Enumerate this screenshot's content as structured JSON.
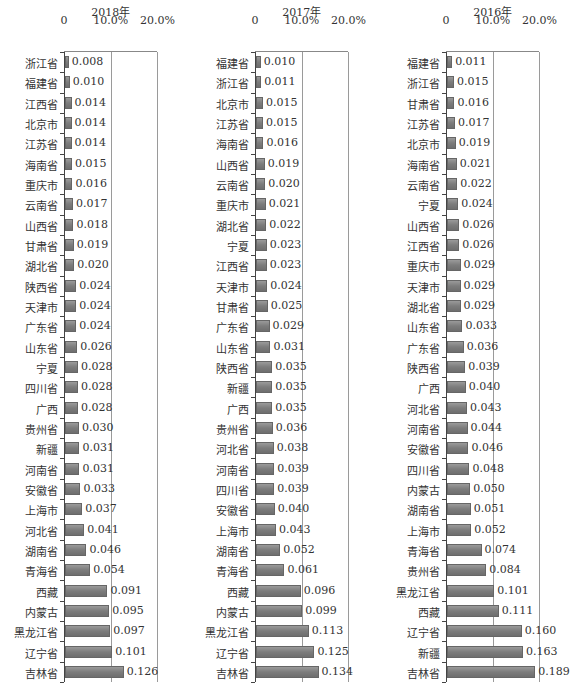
{
  "chart_data": [
    {
      "type": "bar",
      "orientation": "horizontal",
      "title": "2018年",
      "xticks": [
        "0",
        "10.0%",
        "20.0%"
      ],
      "xlim": [
        0,
        0.2
      ],
      "grid": true,
      "categories": [
        "浙江省",
        "福建省",
        "江西省",
        "北京市",
        "江苏省",
        "海南省",
        "重庆市",
        "云南省",
        "山西省",
        "甘肃省",
        "湖北省",
        "陕西省",
        "天津市",
        "广东省",
        "山东省",
        "宁夏",
        "四川省",
        "广西",
        "贵州省",
        "新疆",
        "河南省",
        "安徽省",
        "上海市",
        "河北省",
        "湖南省",
        "青海省",
        "西藏",
        "内蒙古",
        "黑龙江省",
        "辽宁省",
        "吉林省"
      ],
      "values": [
        0.008,
        0.01,
        0.014,
        0.014,
        0.014,
        0.015,
        0.016,
        0.017,
        0.018,
        0.019,
        0.02,
        0.024,
        0.024,
        0.024,
        0.026,
        0.028,
        0.028,
        0.028,
        0.03,
        0.031,
        0.031,
        0.033,
        0.037,
        0.041,
        0.046,
        0.054,
        0.091,
        0.095,
        0.097,
        0.101,
        0.126
      ],
      "labels": [
        "0.008",
        "0.010",
        "0.014",
        "0.014",
        "0.014",
        "0.015",
        "0.016",
        "0.017",
        "0.018",
        "0.019",
        "0.020",
        "0.024",
        "0.024",
        "0.024",
        "0.026",
        "0.028",
        "0.028",
        "0.028",
        "0.030",
        "0.031",
        "0.031",
        "0.033",
        "0.037",
        "0.041",
        "0.046",
        "0.054",
        "0.091",
        "0.095",
        "0.097",
        "0.101",
        "0.126"
      ]
    },
    {
      "type": "bar",
      "orientation": "horizontal",
      "title": "2017年",
      "xticks": [
        "0",
        "10.0%",
        "20.0%"
      ],
      "xlim": [
        0,
        0.2
      ],
      "grid": true,
      "categories": [
        "福建省",
        "浙江省",
        "北京市",
        "江苏省",
        "海南省",
        "山西省",
        "云南省",
        "重庆市",
        "湖北省",
        "宁夏",
        "江西省",
        "天津市",
        "甘肃省",
        "广东省",
        "山东省",
        "陕西省",
        "新疆",
        "广西",
        "贵州省",
        "河北省",
        "河南省",
        "四川省",
        "安徽省",
        "上海市",
        "湖南省",
        "青海省",
        "西藏",
        "内蒙古",
        "黑龙江省",
        "辽宁省",
        "吉林省"
      ],
      "values": [
        0.01,
        0.011,
        0.015,
        0.015,
        0.016,
        0.019,
        0.02,
        0.021,
        0.022,
        0.023,
        0.023,
        0.024,
        0.025,
        0.029,
        0.031,
        0.035,
        0.035,
        0.035,
        0.036,
        0.038,
        0.039,
        0.039,
        0.04,
        0.043,
        0.052,
        0.061,
        0.096,
        0.099,
        0.113,
        0.125,
        0.134
      ],
      "labels": [
        "0.010",
        "0.011",
        "0.015",
        "0.015",
        "0.016",
        "0.019",
        "0.020",
        "0.021",
        "0.022",
        "0.023",
        "0.023",
        "0.024",
        "0.025",
        "0.029",
        "0.031",
        "0.035",
        "0.035",
        "0.035",
        "0.036",
        "0.038",
        "0.039",
        "0.039",
        "0.040",
        "0.043",
        "0.052",
        "0.061",
        "0.096",
        "0.099",
        "0.113",
        "0.125",
        "0.134"
      ]
    },
    {
      "type": "bar",
      "orientation": "horizontal",
      "title": "2016年",
      "xticks": [
        "0",
        "10.0%",
        "20.0%"
      ],
      "xlim": [
        0,
        0.2
      ],
      "grid": true,
      "categories": [
        "福建省",
        "浙江省",
        "甘肃省",
        "江苏省",
        "北京市",
        "海南省",
        "云南省",
        "宁夏",
        "山西省",
        "江西省",
        "重庆市",
        "天津市",
        "湖北省",
        "山东省",
        "广东省",
        "陕西省",
        "广西",
        "河北省",
        "河南省",
        "安徽省",
        "四川省",
        "内蒙古",
        "湖南省",
        "上海市",
        "青海省",
        "贵州省",
        "黑龙江省",
        "西藏",
        "辽宁省",
        "新疆",
        "吉林省"
      ],
      "values": [
        0.011,
        0.015,
        0.016,
        0.017,
        0.019,
        0.021,
        0.022,
        0.024,
        0.026,
        0.026,
        0.029,
        0.029,
        0.029,
        0.033,
        0.036,
        0.039,
        0.04,
        0.043,
        0.044,
        0.046,
        0.048,
        0.05,
        0.051,
        0.052,
        0.074,
        0.084,
        0.101,
        0.111,
        0.16,
        0.163,
        0.189
      ],
      "labels": [
        "0.011",
        "0.015",
        "0.016",
        "0.017",
        "0.019",
        "0.021",
        "0.022",
        "0.024",
        "0.026",
        "0.026",
        "0.029",
        "0.029",
        "0.029",
        "0.033",
        "0.036",
        "0.039",
        "0.040",
        "0.043",
        "0.044",
        "0.046",
        "0.048",
        "0.050",
        "0.051",
        "0.052",
        "0.074",
        "0.084",
        "0.101",
        "0.111",
        "0.160",
        "0.163",
        "0.189"
      ]
    }
  ],
  "style": {
    "bar_color": "#7c7c7c",
    "grid_color": "#9a9a9a",
    "axis_color": "#444444"
  }
}
